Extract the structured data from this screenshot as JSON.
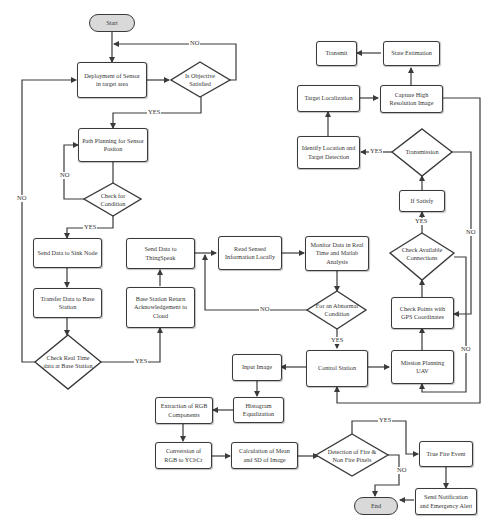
{
  "flowchart": {
    "terminals": {
      "start": "Start",
      "end": "End"
    },
    "process": {
      "deploy": "Deployment of Sensor in target area",
      "path_planning": "Path Planning for Sensor Positon",
      "send_sink": "Send Data to Sink Node",
      "transfer_base": "Transfer Data to Base Station",
      "send_thingspeak": "Send Data to ThingSpeak",
      "base_return": "Base Station Return Acknowledgement to Cloud",
      "read_sensed": "Read Sensed Information Locally",
      "monitor": "Monitor Data in Real Time and Matlab Analysis",
      "control_station": "Control Station",
      "mission_planning": "Mission Planning UAV",
      "check_points": "Check Points with GPS Coordinates",
      "if_satisfy": "If Satisfy",
      "identify_location": "Identify Location and Target Detection",
      "target_localization": "Target Localization",
      "capture_image": "Capture High Resolution Image",
      "state_estimation": "State Estimation",
      "transmit": "Transmit",
      "input_image": "Input Image",
      "histogram": "Histogram Equalization",
      "extraction_rgb": "Extraction of RGB Components",
      "conversion": "Conversion of RGB to YCbCr",
      "calc_mean": "Calculation of Mean and SD of Image",
      "true_fire": "True Fire Event",
      "send_notification": "Send Notification and Emergency Alert"
    },
    "decisions": {
      "objective": "Is Objective Satisfied",
      "check_condition": "Check for Condition",
      "check_realtime": "Check Real Time data at Base Station",
      "abnormal": "For an Abnormal Condition",
      "available_conn": "Check Available Connections",
      "transmission": "Transmission",
      "fire_detection": "Detection of Fire & Non Fire Pixels"
    },
    "edge_labels": {
      "yes": "YES",
      "no": "NO"
    },
    "colors": {
      "line": "#3a3a3a",
      "terminal_fill": "#d9d9d9",
      "box_fill": "#ffffff"
    }
  }
}
